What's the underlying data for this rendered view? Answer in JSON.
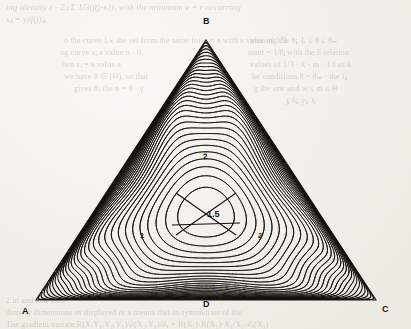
{
  "page": {
    "kind": "scanned-book-page",
    "background_color": "#f1efe9",
    "ink_color": "#161410"
  },
  "figure": {
    "name": "triangular-contour-plot",
    "vertices": [
      {
        "id": "B",
        "label": "B",
        "position": "top-apex",
        "x": 206,
        "y": 40
      },
      {
        "id": "A",
        "label": "A",
        "position": "bottom-left",
        "x": 36,
        "y": 300
      },
      {
        "id": "C",
        "label": "C",
        "position": "bottom-right",
        "x": 376,
        "y": 300
      },
      {
        "id": "D",
        "label": "D",
        "position": "bottom-midpoint",
        "x": 206,
        "y": 300
      }
    ],
    "annotations": [
      {
        "id": "saddle",
        "label": "1.5",
        "x": 207,
        "y": 213,
        "note": "saddle point contour value"
      },
      {
        "id": "eye-top",
        "label": "2",
        "x": 207,
        "y": 157,
        "note": "upper local extremum"
      },
      {
        "id": "eye-left",
        "label": "2",
        "x": 144,
        "y": 236,
        "note": "lower-left local extremum"
      },
      {
        "id": "eye-right",
        "label": "2",
        "x": 262,
        "y": 236,
        "note": "lower-right local extremum"
      }
    ]
  },
  "chart_data": {
    "type": "contour",
    "title": "",
    "xlabel": "",
    "ylabel": "",
    "domain": "equilateral triangle A-B-C with midpoint D on AC",
    "symmetry": "three-fold (C3v)",
    "contour_levels": [
      0.1,
      0.25,
      0.4,
      0.55,
      0.7,
      0.85,
      1.0,
      1.15,
      1.3,
      1.5,
      1.7,
      1.85,
      2.0
    ],
    "labeled_levels": [
      {
        "value": 1.5,
        "label": "1.5",
        "type": "saddle"
      },
      {
        "value": 2.0,
        "label": "2",
        "type": "extremum"
      }
    ],
    "critical_points": [
      {
        "type": "saddle",
        "x_norm": 0.5,
        "y_norm": 0.47,
        "value": 1.5
      },
      {
        "type": "maximum",
        "x_norm": 0.5,
        "y_norm": 0.72,
        "value": 2.0
      },
      {
        "type": "maximum",
        "x_norm": 0.33,
        "y_norm": 0.26,
        "value": 2.0
      },
      {
        "type": "maximum",
        "x_norm": 0.67,
        "y_norm": 0.26,
        "value": 2.0
      }
    ],
    "grid": false,
    "legend": "none"
  },
  "ghost_text": {
    "note": "faint bleed-through of printed text from the reverse side of the sheet",
    "top": [
      "ing identity  r - Σⱼⱼ  Σ 1/3(f(j-n)), with the minimum  v = r  occurring",
      "xⱼⱼ = yⱼ/f(j)ⱼⱼₓ"
    ],
    "left_block": [
      "o the curve I₍ₙ₎ the set from the same for y = a with a value of 1/3.",
      "ng curve  xⱼ  a value n · 0,",
      "hen  xⱼ = a value a",
      "we have  θ ∈ (Θ), so that",
      "gives  θ, the  n = 0 · γ"
    ],
    "right_block": [
      "rmining the θⱼ, L ≤ θ ≤ θₘ",
      "stant = 1/θⱼ with the δ relation",
      "values of 1/3 · k · m · 1 f or  k",
      "he conditions  θ = θₘ · the fᵢⱼ",
      "g the  one and  w ≤ m ≤ Θ",
      "∫ⱼ δⱼ, yⱼ, fⱼ"
    ],
    "bottom": [
      "2  in  and  and  with",
      "densely dimensions  or  displayed  or  a  means that  in  symmetries  of  the",
      "The  gradient  variate  R(X,Y₁,Y₂,Y₃)/∂(X₁,Y₂)/∂ₓ = R(X₂)·R(X₃)·X₁/X₂·∂ₓ(X₃)"
    ]
  }
}
